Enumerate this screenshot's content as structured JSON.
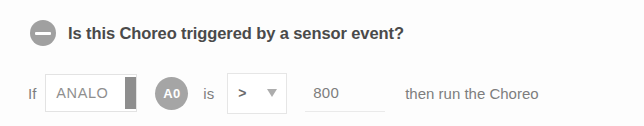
{
  "header": {
    "collapse_icon": "minus-circle-icon",
    "title": "Is this Choreo triggered by a sensor event?"
  },
  "condition": {
    "if_label": "If",
    "sensor_input": {
      "value": "ANALO",
      "placeholder": "ANALO",
      "scrollbar": "vertical-scrollbar-thumb"
    },
    "pin_badge": "A0",
    "is_label": "is",
    "operator_select": {
      "value": ">",
      "caret_icon": "caret-down-icon",
      "options": [
        ">",
        "<",
        "=",
        ">=",
        "<=",
        "!="
      ]
    },
    "threshold_input": {
      "value": "800",
      "placeholder": "800"
    },
    "trailing_label": "then run the Choreo"
  },
  "colors": {
    "icon_gray": "#a0a0a0",
    "badge_gray": "#a5a5a5",
    "text_gray": "#7d7d7d",
    "heading_gray": "#4a4a4a",
    "border_gray": "#e3e3e3",
    "thumb_gray": "#8e8e8e",
    "background": "#fdfdfd"
  }
}
